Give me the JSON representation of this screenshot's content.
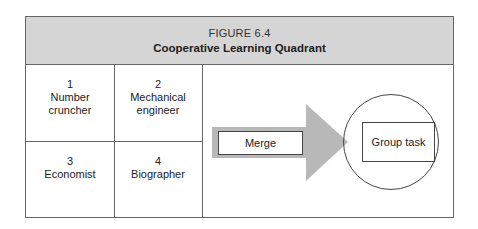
{
  "figure": {
    "number": "FIGURE 6.4",
    "title": "Cooperative Learning Quadrant"
  },
  "quadrant": [
    {
      "num": "1",
      "label_line1": "Number",
      "label_line2": "cruncher"
    },
    {
      "num": "2",
      "label_line1": "Mechanical",
      "label_line2": "engineer"
    },
    {
      "num": "3",
      "label_line1": "Economist",
      "label_line2": ""
    },
    {
      "num": "4",
      "label_line1": "Biographer",
      "label_line2": ""
    }
  ],
  "flow": {
    "arrow_label": "Merge",
    "target_label": "Group task"
  },
  "colors": {
    "header_bg": "#d5d5d5",
    "arrow_fill": "#b8b8b8",
    "border": "#666666"
  }
}
